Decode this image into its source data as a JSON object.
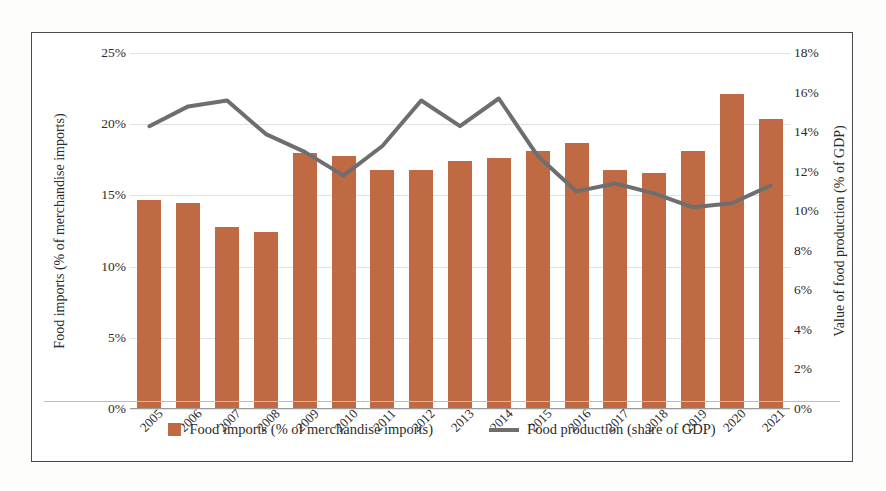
{
  "chart_data": {
    "type": "bar",
    "title": "",
    "xlabel": "",
    "categories": [
      "2005",
      "2006",
      "2007",
      "2008",
      "2009",
      "2010",
      "2011",
      "2012",
      "2013",
      "2014",
      "2015",
      "2016",
      "2017",
      "2018",
      "2019",
      "2020",
      "2021"
    ],
    "grid": true,
    "legend_position": "bottom",
    "axes": {
      "left": {
        "label": "Food imports (% of merchandise imports)",
        "ticks": [
          "0%",
          "5%",
          "10%",
          "15%",
          "20%",
          "25%"
        ],
        "tick_values": [
          0,
          5,
          10,
          15,
          20,
          25
        ],
        "ylim": [
          0,
          25
        ]
      },
      "right": {
        "label": "Value of food production (% of GDP)",
        "ticks": [
          "0%",
          "2%",
          "4%",
          "6%",
          "8%",
          "10%",
          "12%",
          "14%",
          "16%",
          "18%"
        ],
        "tick_values": [
          0,
          2,
          4,
          6,
          8,
          10,
          12,
          14,
          16,
          18
        ],
        "ylim": [
          0,
          18
        ]
      }
    },
    "series": [
      {
        "name": "Food imports (% of merchandise imports)",
        "type": "bar",
        "axis": "left",
        "color": "#c06a44",
        "values": [
          14.7,
          14.5,
          12.8,
          12.4,
          18.0,
          17.8,
          16.8,
          16.8,
          17.4,
          17.6,
          18.1,
          18.7,
          16.8,
          16.6,
          18.1,
          22.1,
          20.4
        ]
      },
      {
        "name": "Food production (share of GDP)",
        "type": "line",
        "axis": "right",
        "color": "#6e6e6e",
        "values": [
          14.3,
          15.3,
          15.6,
          13.9,
          13.0,
          11.8,
          13.3,
          15.6,
          14.3,
          15.7,
          12.8,
          11.0,
          11.4,
          10.9,
          10.2,
          10.4,
          11.3
        ]
      }
    ]
  },
  "legend": {
    "items": [
      {
        "label": "Food imports (% of merchandise imports)",
        "marker": "square-swatch"
      },
      {
        "label": "Food production (share of GDP)",
        "marker": "line-swatch"
      }
    ]
  }
}
